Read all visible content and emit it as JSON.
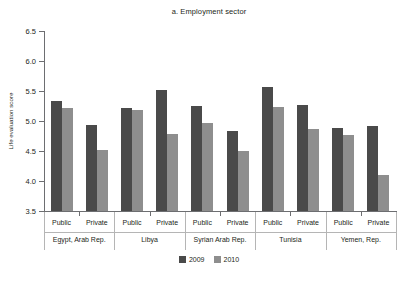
{
  "chart_data": {
    "type": "bar",
    "title": "a. Employment sector",
    "xlabel": "",
    "ylabel": "Life evaluation score",
    "ylim": [
      3.5,
      6.5
    ],
    "ytick_step": 0.5,
    "yticks": [
      "6.5",
      "6.0",
      "5.5",
      "5.0",
      "4.5",
      "4.0",
      "3.5"
    ],
    "grid": false,
    "legend_position": "bottom-center",
    "series": [
      {
        "name": "2009",
        "color": "#4a4a4a",
        "values": [
          5.33,
          4.93,
          5.21,
          5.51,
          5.25,
          4.84,
          5.57,
          5.27,
          4.88,
          4.92
        ]
      },
      {
        "name": "2010",
        "color": "#8e8e8e",
        "values": [
          5.22,
          4.52,
          5.18,
          4.79,
          4.96,
          4.5,
          5.23,
          4.86,
          4.76,
          4.1
        ]
      }
    ],
    "categories": [
      "Public",
      "Private",
      "Public",
      "Private",
      "Public",
      "Private",
      "Public",
      "Private",
      "Public",
      "Private"
    ],
    "groups": [
      {
        "label": "Egypt, Arab Rep.",
        "subgroups": [
          {
            "label": "Public",
            "2009": 5.33,
            "2010": 5.22
          },
          {
            "label": "Private",
            "2009": 4.93,
            "2010": 4.52
          }
        ]
      },
      {
        "label": "Libya",
        "subgroups": [
          {
            "label": "Public",
            "2009": 5.21,
            "2010": 5.18
          },
          {
            "label": "Private",
            "2009": 5.51,
            "2010": 4.79
          }
        ]
      },
      {
        "label": "Syrian Arab Rep.",
        "subgroups": [
          {
            "label": "Public",
            "2009": 5.25,
            "2010": 4.96
          },
          {
            "label": "Private",
            "2009": 4.84,
            "2010": 4.5
          }
        ]
      },
      {
        "label": "Tunisia",
        "subgroups": [
          {
            "label": "Public",
            "2009": 5.57,
            "2010": 5.23
          },
          {
            "label": "Private",
            "2009": 5.27,
            "2010": 4.86
          }
        ]
      },
      {
        "label": "Yemen, Rep.",
        "subgroups": [
          {
            "label": "Public",
            "2009": 4.88,
            "2010": 4.76
          },
          {
            "label": "Private",
            "2009": 4.92,
            "2010": 4.1
          }
        ]
      }
    ]
  },
  "legend": {
    "entries": [
      {
        "label": "2009",
        "color": "#4a4a4a"
      },
      {
        "label": "2010",
        "color": "#8e8e8e"
      }
    ]
  },
  "colors": {
    "series_2009": "#4a4a4a",
    "series_2010": "#8e8e8e",
    "axis": "#6d6e71",
    "text": "#231f20",
    "background": "#ffffff"
  }
}
